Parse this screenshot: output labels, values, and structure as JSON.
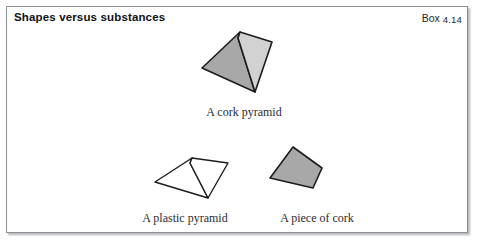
{
  "box": {
    "title": "Shapes versus substances",
    "label_prefix": "Box ",
    "label_number": "4.14"
  },
  "figures": [
    {
      "name": "cork-pyramid",
      "caption": "A cork pyramid",
      "filled": true,
      "faces": [
        {
          "name": "left-face",
          "points": "240,32 202,68 255,92 238,38",
          "fill": "#a8a8a8"
        },
        {
          "name": "right-face",
          "points": "240,32 272,42 255,92 238,38",
          "fill": "#d2d2d2"
        }
      ],
      "outline": "#1c1c1c"
    },
    {
      "name": "plastic-pyramid",
      "caption": "A plastic pyramid",
      "filled": false,
      "faces": [
        {
          "name": "left-face",
          "points": "192,158 155,182 208,198 190,163",
          "fill": "#ffffff"
        },
        {
          "name": "right-face",
          "points": "192,158 228,163 208,198 190,163",
          "fill": "#ffffff"
        }
      ],
      "outline": "#1c1c1c"
    },
    {
      "name": "piece-of-cork",
      "caption": "A piece of cork",
      "filled": true,
      "faces": [
        {
          "name": "body",
          "points": "293,147 270,178 313,188 322,168",
          "fill": "#a8a8a8"
        }
      ],
      "outline": "#1c1c1c"
    }
  ],
  "colors": {
    "fill_dark": "#a8a8a8",
    "fill_light": "#d2d2d2",
    "outline": "#1c1c1c",
    "border": "#8d9097",
    "text": "#101114"
  }
}
